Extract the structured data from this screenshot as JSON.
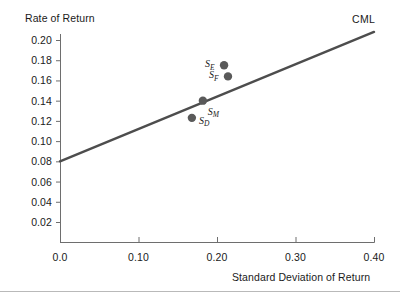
{
  "chart_data": {
    "type": "scatter",
    "title": "",
    "ylabel": "Rate of Return",
    "xlabel": "Standard Deviation of Return",
    "xlim": [
      0.0,
      0.4
    ],
    "ylim": [
      0.0,
      0.21
    ],
    "grid": false,
    "legend_position": "none",
    "x_ticks": [
      {
        "value": 0.0,
        "label": "0.0"
      },
      {
        "value": 0.1,
        "label": "0.10"
      },
      {
        "value": 0.2,
        "label": "0.20"
      },
      {
        "value": 0.3,
        "label": "0.30"
      },
      {
        "value": 0.4,
        "label": "0.40"
      }
    ],
    "y_ticks": [
      {
        "value": 0.02,
        "label": "0.02"
      },
      {
        "value": 0.04,
        "label": "0.04"
      },
      {
        "value": 0.06,
        "label": "0.06"
      },
      {
        "value": 0.08,
        "label": "0.08"
      },
      {
        "value": 0.1,
        "label": "0.10"
      },
      {
        "value": 0.12,
        "label": "0.12"
      },
      {
        "value": 0.14,
        "label": "0.14"
      },
      {
        "value": 0.16,
        "label": "0.16"
      },
      {
        "value": 0.18,
        "label": "0.18"
      },
      {
        "value": 0.2,
        "label": "0.20"
      }
    ],
    "series": [
      {
        "name": "CML",
        "type": "line",
        "annotation": "CML",
        "x": [
          0.0,
          0.4
        ],
        "y": [
          0.08,
          0.208
        ],
        "color": "#4d4d4d"
      },
      {
        "name": "portfolios",
        "type": "scatter",
        "color": "#5a5a5a",
        "points": [
          {
            "label": "S",
            "subscript": "E",
            "x": 0.209,
            "y": 0.175,
            "label_side": "left"
          },
          {
            "label": "S",
            "subscript": "F",
            "x": 0.214,
            "y": 0.164,
            "label_side": "left"
          },
          {
            "label": "S",
            "subscript": "M",
            "x": 0.182,
            "y": 0.14,
            "label_side": "right-below"
          },
          {
            "label": "S",
            "subscript": "D",
            "x": 0.168,
            "y": 0.123,
            "label_side": "right"
          }
        ]
      }
    ]
  },
  "axes": {
    "y_axis_title": "Rate of Return",
    "x_axis_title": "Standard Deviation of Return"
  },
  "annotations": {
    "cml": "CML"
  },
  "colors": {
    "line": "#4d4d4d",
    "point": "#5a5a5a",
    "axis": "#6e6e6e",
    "text": "#1a1a1a",
    "rule": "#b9b9b9",
    "background": "#ffffff"
  }
}
